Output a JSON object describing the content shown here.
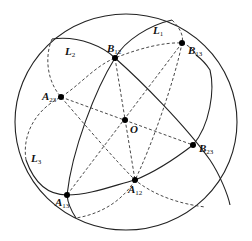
{
  "figure": {
    "great_circles": [
      {
        "id": "L1",
        "label": "L",
        "sub": "1"
      },
      {
        "id": "L2",
        "label": "L",
        "sub": "2"
      },
      {
        "id": "L3",
        "label": "L",
        "sub": "3"
      }
    ],
    "points": {
      "O": {
        "label": "O",
        "sub": ""
      },
      "B12": {
        "label": "B",
        "sub": "12"
      },
      "B13": {
        "label": "B",
        "sub": "13"
      },
      "B23": {
        "label": "B",
        "sub": "23"
      },
      "A12": {
        "label": "A",
        "sub": "12"
      },
      "A13": {
        "label": "A",
        "sub": "13"
      },
      "A23": {
        "label": "A",
        "sub": "23"
      }
    },
    "colors": {
      "stroke": "#222222",
      "background": "#ffffff"
    }
  }
}
